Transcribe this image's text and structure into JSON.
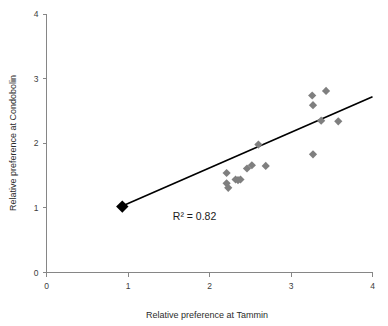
{
  "chart_data": {
    "type": "scatter",
    "title": "",
    "xlabel": "Relative preference at Tammin",
    "ylabel": "Relative preference at Condobolin",
    "xlim": [
      0,
      4
    ],
    "ylim": [
      0,
      4
    ],
    "xticks": [
      "0",
      "1",
      "2",
      "3",
      "4"
    ],
    "yticks": [
      "0",
      "1",
      "2",
      "3",
      "4"
    ],
    "xtick_values": [
      0,
      1,
      2,
      3,
      4
    ],
    "ytick_values": [
      0,
      1,
      2,
      3,
      4
    ],
    "grid": false,
    "legend": false,
    "annotations": [
      {
        "text": "R² = 0.82",
        "x": 1.55,
        "y": 0.82
      }
    ],
    "marker_style": "diamond",
    "series": [
      {
        "name": "Observations",
        "color": "#7f7f7f",
        "points": [
          {
            "x": 2.21,
            "y": 1.54
          },
          {
            "x": 2.21,
            "y": 1.38
          },
          {
            "x": 2.23,
            "y": 1.31
          },
          {
            "x": 2.32,
            "y": 1.44
          },
          {
            "x": 2.35,
            "y": 1.43
          },
          {
            "x": 2.38,
            "y": 1.44
          },
          {
            "x": 2.46,
            "y": 1.61
          },
          {
            "x": 2.52,
            "y": 1.66
          },
          {
            "x": 2.6,
            "y": 1.98
          },
          {
            "x": 2.69,
            "y": 1.65
          },
          {
            "x": 3.26,
            "y": 2.74
          },
          {
            "x": 3.27,
            "y": 2.59
          },
          {
            "x": 3.27,
            "y": 1.83
          },
          {
            "x": 3.37,
            "y": 2.35
          },
          {
            "x": 3.43,
            "y": 2.81
          },
          {
            "x": 3.58,
            "y": 2.34
          }
        ]
      },
      {
        "name": "Reference",
        "color": "#000000",
        "points": [
          {
            "x": 0.93,
            "y": 1.02
          }
        ]
      }
    ],
    "trendline": {
      "color": "#000000",
      "x_start": 0.93,
      "y_start": 1.03,
      "x_end": 4.0,
      "y_end": 2.72
    }
  }
}
